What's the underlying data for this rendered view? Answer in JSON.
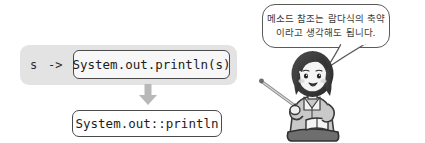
{
  "diagram": {
    "lambda": {
      "param": "s",
      "arrow": "->",
      "body": "System.out.println(s)"
    },
    "transform_icon": "down-arrow-icon",
    "result": "System.out::println"
  },
  "speech": {
    "line1": "메소드 참조는 람다식의 축약",
    "line2": "이라고 생각해도 됩니다.",
    "tail_icon": "speech-tail-icon"
  },
  "character": {
    "icon": "teacher-character-icon",
    "description": "여성 강사"
  },
  "colors": {
    "panel_gray": "#e3e3e3",
    "box_border": "#4a4a4a",
    "arrow_gray": "#b8b8b8",
    "text_dark": "#1c1c1c",
    "bubble_border": "#5a5a5a"
  }
}
